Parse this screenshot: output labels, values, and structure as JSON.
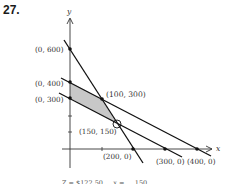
{
  "problem": {
    "number": "27."
  },
  "axes": {
    "x_label": "x",
    "y_label": "y"
  },
  "points": [
    {
      "label": "(0, 600)",
      "x": 0,
      "y": 600
    },
    {
      "label": "(0, 400)",
      "x": 0,
      "y": 400
    },
    {
      "label": "(0, 300)",
      "x": 0,
      "y": 300
    },
    {
      "label": "(100, 300)",
      "x": 100,
      "y": 300
    },
    {
      "label": "(150, 150)",
      "x": 150,
      "y": 150
    },
    {
      "label": "(200, 0)",
      "x": 200,
      "y": 0
    },
    {
      "label": "(300, 0)",
      "x": 300,
      "y": 0
    },
    {
      "label": "(400, 0)",
      "x": 400,
      "y": 0
    }
  ],
  "lines": [
    {
      "name": "line-600-200",
      "from": [
        0,
        600
      ],
      "to": [
        200,
        0
      ]
    },
    {
      "name": "line-400-400",
      "from": [
        0,
        400
      ],
      "to": [
        400,
        0
      ]
    },
    {
      "name": "line-300-300",
      "from": [
        0,
        300
      ],
      "to": [
        300,
        0
      ]
    }
  ],
  "feasible_region": {
    "vertices": [
      [
        0,
        400
      ],
      [
        100,
        300
      ],
      [
        150,
        150
      ],
      [
        0,
        300
      ]
    ],
    "fill": "#c8c8c8"
  },
  "highlighted_point": {
    "label": "(150, 150)",
    "marker": "open-circle"
  },
  "caption": "Z = $122.50 ... x = ... 150 ..."
}
